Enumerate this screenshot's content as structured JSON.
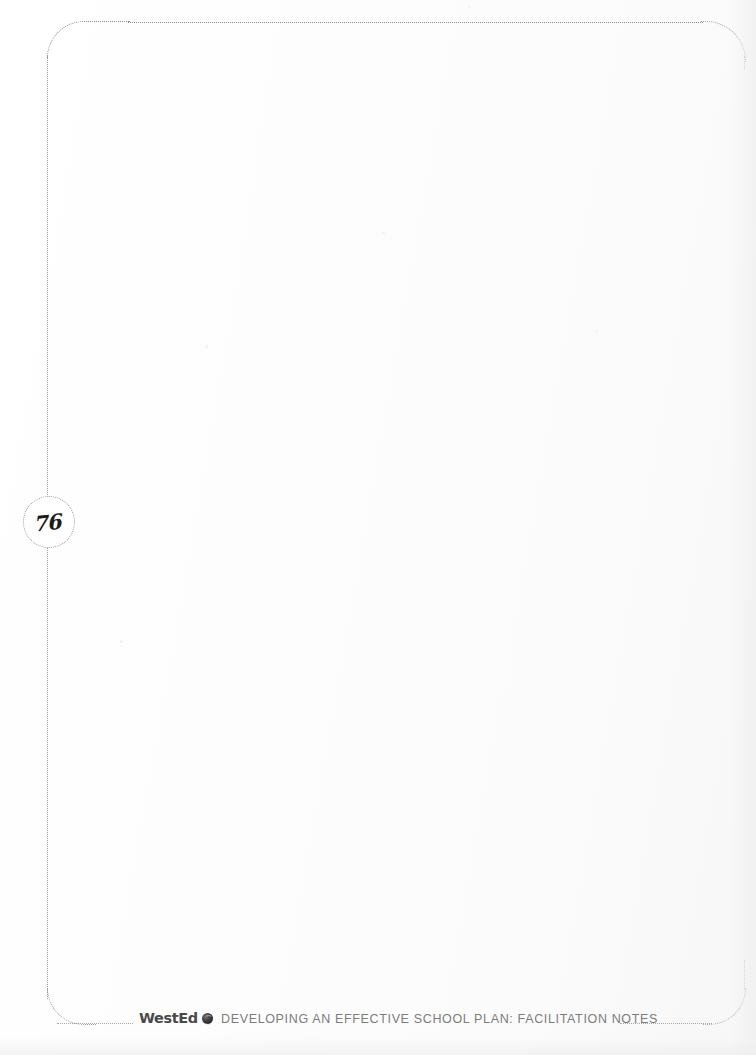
{
  "document": {
    "page_number": "76",
    "page_kind": "blank-notes-page",
    "body_text": ""
  },
  "frame": {
    "style": "dotted-rounded-border",
    "color": "#9a9a9a"
  },
  "footer": {
    "logo_wordmark": "WestEd",
    "logo_icon": "globe-icon",
    "title": "DEVELOPING AN EFFECTIVE SCHOOL PLAN: FACILITATION NOTES",
    "rule_style": "dotted",
    "text_color": "#7c7c7c"
  },
  "colors": {
    "paper": "#fefefe",
    "ink": "#1b1b1b",
    "rule": "#9a9a9a",
    "footer_text": "#7c7c7c",
    "logo": "#4a4a4a"
  }
}
